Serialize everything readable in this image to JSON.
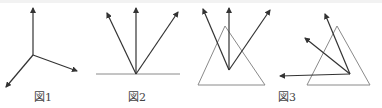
{
  "figures": [
    {
      "id": "fig1",
      "label": "図1",
      "description": "Three vectors from a common point",
      "origin": [
        33,
        55
      ],
      "vectors": [
        [
          33,
          8
        ],
        [
          77,
          71
        ],
        [
          6,
          87
        ]
      ]
    },
    {
      "id": "fig2",
      "label": "図2",
      "description": "Three vectors from a point on a horizontal line",
      "baseline": [
        [
          96,
          74
        ],
        [
          180,
          74
        ]
      ],
      "origin": [
        136,
        74
      ],
      "vectors": [
        [
          107,
          13
        ],
        [
          136,
          8
        ],
        [
          178,
          12
        ]
      ]
    },
    {
      "id": "fig3",
      "label": "図3",
      "parts": [
        {
          "description": "Three vectors from a point inside a triangle",
          "triangle": [
            [
              198,
              85
            ],
            [
              225,
              26
            ],
            [
              265,
              85
            ]
          ],
          "origin": [
            229,
            70
          ],
          "vectors": [
            [
              203,
              9
            ],
            [
              229,
              8
            ],
            [
              270,
              10
            ]
          ]
        },
        {
          "description": "Three vectors from a vertex-region point of a triangle",
          "triangle": [
            [
              307,
              85
            ],
            [
              337,
              26
            ],
            [
              370,
              85
            ]
          ],
          "origin": [
            350,
            74
          ],
          "vectors": [
            [
              325,
              14
            ],
            [
              305,
              38
            ],
            [
              280,
              76
            ]
          ]
        }
      ]
    }
  ],
  "colors": {
    "vector": "#333333",
    "triangle": "#8a8a8a",
    "label": "#444444"
  }
}
